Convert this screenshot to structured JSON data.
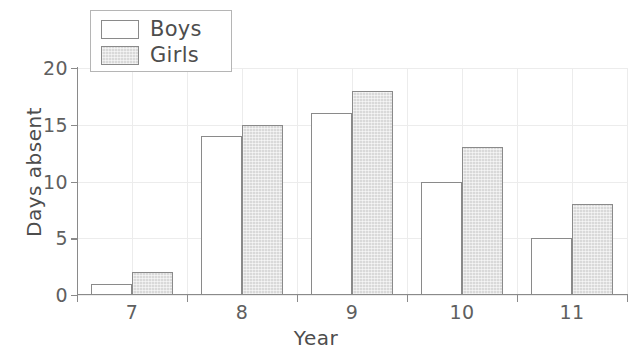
{
  "chart_data": {
    "type": "bar",
    "title": "",
    "xlabel": "Year",
    "ylabel": "Days absent",
    "categories": [
      "7",
      "8",
      "9",
      "10",
      "11"
    ],
    "series": [
      {
        "name": "Boys",
        "values": [
          1,
          14,
          16,
          10,
          5
        ],
        "fill": "#ffffff",
        "stroke": "#8a8a8a"
      },
      {
        "name": "Girls",
        "values": [
          2,
          15,
          18,
          13,
          8
        ],
        "fill": "#d9d9d9",
        "stroke": "#8a8a8a"
      }
    ],
    "ylim": [
      0,
      20
    ],
    "yticks": [
      0,
      5,
      10,
      15,
      20
    ],
    "ytick_labels": [
      "0",
      "5",
      "10",
      "15",
      "20"
    ],
    "xtick_labels": [
      "7",
      "8",
      "9",
      "10",
      "11"
    ],
    "grid": true,
    "grid_color": "#ececec",
    "legend_position": "top-left",
    "axis_color": "#8a8a8a",
    "background": "#ffffff"
  },
  "legend": {
    "entries": [
      {
        "label": "Boys"
      },
      {
        "label": "Girls"
      }
    ]
  },
  "axes": {
    "y_title": "Days absent",
    "x_title": "Year"
  }
}
